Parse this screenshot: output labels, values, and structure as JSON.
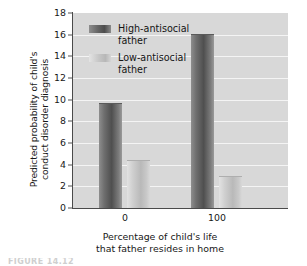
{
  "chart_data": {
    "type": "bar",
    "title": "",
    "categories": [
      "0",
      "100"
    ],
    "series": [
      {
        "name": "High-antisocial father",
        "values": [
          9.6,
          16.0
        ],
        "color": "#5a5a5a"
      },
      {
        "name": "Low-antisocial father",
        "values": [
          4.3,
          2.9
        ],
        "color": "#c3c3c3"
      }
    ],
    "xlabel": "Percentage of child's life that father resides in home",
    "xlabel_line1": "Percentage of child's life",
    "xlabel_line2": "that father resides in home",
    "ylabel": "Predicted probability of child's conduct disorder diagnosis",
    "ylabel_line1": "Predicted probability of child's",
    "ylabel_line2": "conduct disorder diagnosis",
    "ylim": [
      0,
      18
    ],
    "ytick_step": 2,
    "yticks": [
      "18",
      "16",
      "14",
      "12",
      "10",
      "8",
      "6",
      "4",
      "2",
      "0"
    ],
    "grid": true,
    "grid_color": "#f4f4f4",
    "plot_background": "#d8d8d8",
    "legend_position": "top-left-inside",
    "legend": [
      {
        "label_line1": "High-antisocial",
        "label_line2": "father",
        "swatch": "dark-gray-gradient"
      },
      {
        "label_line1": "Low-antisocial",
        "label_line2": "father",
        "swatch": "light-gray-gradient"
      }
    ]
  },
  "caption": "FIGURE 14.12"
}
